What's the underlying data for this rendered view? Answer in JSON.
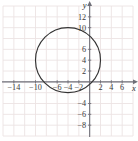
{
  "figure": {
    "title": "",
    "background_color": "#ffffff",
    "width": 138,
    "height": 141
  },
  "chart_data": {
    "type": "scatter",
    "title": "",
    "xlabel": "x",
    "ylabel": "y",
    "grid": true,
    "legend": null,
    "xlim": [
      -16,
      8
    ],
    "ylim": [
      -10,
      14
    ],
    "x_ticks": [
      -14,
      -10,
      -6,
      -4,
      -2,
      2,
      4,
      6
    ],
    "x_tick_labels": [
      "−14",
      "−10",
      "−6",
      "−4",
      "−2",
      "2",
      "4",
      "6"
    ],
    "y_ticks": [
      12,
      10,
      6,
      4,
      2,
      -4,
      -6,
      -8
    ],
    "y_tick_labels": [
      "12",
      "10",
      "6",
      "4",
      "2",
      "−4",
      "−6",
      "−8"
    ],
    "grid_step": 2,
    "shapes": [
      {
        "kind": "circle",
        "center_x": -4,
        "center_y": 4,
        "radius": 6,
        "stroke_color": "#333333",
        "fill": "none",
        "equation": "(x + 4)² + (y − 4)² = 36"
      }
    ],
    "series": []
  },
  "colors": {
    "grid_line": "#ece3e3",
    "axis_line": "#6f6f78",
    "curve": "#333333",
    "tick_text": "#3a3a3a"
  },
  "axes": {
    "x_axis_label": "x",
    "y_axis_label": "y",
    "x_arrow": "arrow-right",
    "y_arrow": "arrow-up"
  }
}
